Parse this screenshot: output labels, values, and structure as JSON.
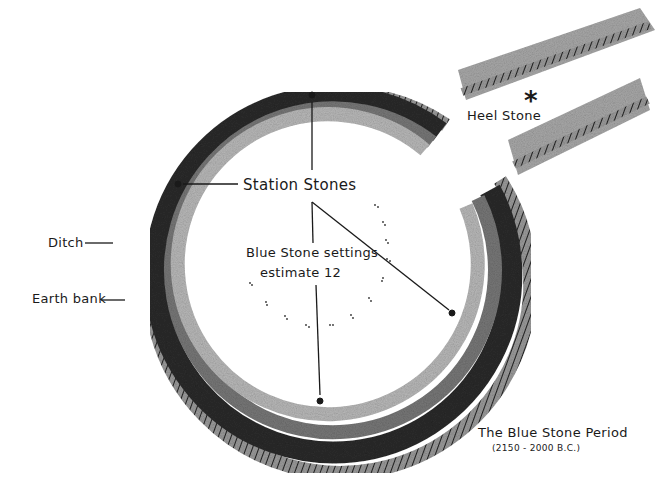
{
  "diagram": {
    "title": "The Blue Stone Period",
    "subtitle": "(2150 - 2000 B.C.)",
    "labels": {
      "heel_stone": "Heel Stone",
      "heel_stone_marker": "*",
      "station_stones": "Station Stones",
      "blue_stone_line1": "Blue Stone settings",
      "blue_stone_line2": "estimate 12",
      "ditch": "Ditch",
      "earth_bank": "Earth bank"
    },
    "colors": {
      "ink": "#1a1a1a",
      "ditch_dark": "#2b2b2b",
      "bank_mid": "#7a7a7a",
      "bank_light": "#b5b5b5",
      "background": "#ffffff"
    },
    "station_stones_count": 4,
    "blue_stone_count_estimate": 12
  }
}
